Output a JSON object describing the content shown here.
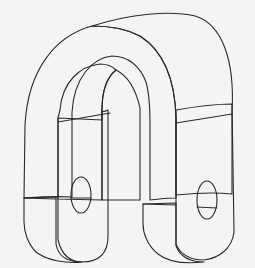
{
  "figure": {
    "colors": {
      "background": "#f4f4f4",
      "outer_face": "#fbfbfb",
      "inner_face": "#b9b9b9",
      "side_face": "#c4c4c4",
      "hole": "#ffffff",
      "edge": "#2a2a2a"
    },
    "parts": [
      "outer-curved-face",
      "inner-curved-face",
      "left-leg",
      "right-leg",
      "left-pin-hole",
      "right-pin-hole"
    ]
  }
}
